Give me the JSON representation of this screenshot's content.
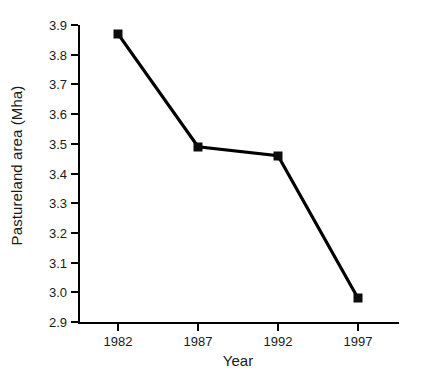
{
  "chart_data": {
    "type": "line",
    "title": "",
    "xlabel": "Year",
    "ylabel": "Pastureland area (Mha)",
    "categories": [
      "1982",
      "1987",
      "1992",
      "1997"
    ],
    "values": [
      3.87,
      3.49,
      3.46,
      2.98
    ],
    "series": [
      {
        "name": "Pastureland area",
        "values": [
          3.87,
          3.49,
          3.46,
          2.98
        ]
      }
    ],
    "ylim": [
      2.9,
      3.9
    ],
    "ytick_labels": [
      "2.9",
      "3.0",
      "3.1",
      "3.2",
      "3.3",
      "3.4",
      "3.5",
      "3.6",
      "3.7",
      "3.8",
      "3.9"
    ],
    "ytick_values": [
      2.9,
      3.0,
      3.1,
      3.2,
      3.3,
      3.4,
      3.5,
      3.6,
      3.7,
      3.8,
      3.9
    ],
    "xtick_labels": [
      "1982",
      "1987",
      "1992",
      "1997"
    ],
    "grid": false,
    "legend": false,
    "legend_position": "none",
    "marker": "square",
    "line_color": "#000000",
    "marker_color": "#0d0d0d",
    "background_color": "#ffffff"
  }
}
